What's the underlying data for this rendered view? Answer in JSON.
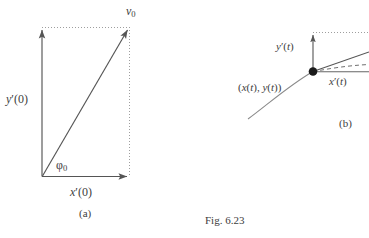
{
  "figure": {
    "caption": "Fig. 6.23",
    "panel_a": {
      "tag": "(a)",
      "vector_label": "v",
      "vector_label_sub": "0",
      "y_component_label": "y",
      "y_component_prime": "′",
      "y_component_arg": "(0)",
      "x_component_label": "x",
      "x_component_prime": "′",
      "x_component_arg": "(0)",
      "angle_label": "φ",
      "angle_label_sub": "0"
    },
    "panel_b": {
      "tag": "(b)",
      "y_component_label": "y",
      "y_component_prime": "′",
      "y_component_arg": "(t)",
      "x_component_label": "x",
      "x_component_prime": "′",
      "x_component_arg": "(t)",
      "point_label_open": "(",
      "point_label_x": "x",
      "point_label_xarg": "(t)",
      "point_label_sep": ", ",
      "point_label_y": "y",
      "point_label_yarg": "(t)",
      "point_label_close": ")"
    }
  },
  "colors": {
    "stroke": "#555555",
    "dotted": "#9a9a9a",
    "text": "#3d3d3d",
    "background": "#ffffff",
    "dot_fill": "#1a1a1a"
  }
}
